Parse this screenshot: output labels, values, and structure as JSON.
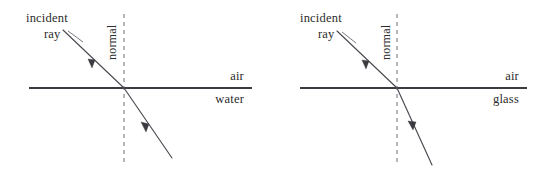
{
  "figure": {
    "type": "physics-optics-refraction-diagram",
    "panel_count": 2,
    "panels": [
      {
        "id": "water",
        "labels": {
          "incident_ray_line1": "incident",
          "incident_ray_line2": "ray",
          "normal": "normal",
          "upper_medium": "air",
          "lower_medium": "water"
        },
        "geometry": {
          "interface_y": 88,
          "interface_x_start": 29,
          "interface_x_end": 252,
          "normal_x": 124,
          "normal_y_top": 14,
          "normal_y_bottom": 162,
          "incidence_point_x": 124,
          "incidence_point_y": 88,
          "incident_start_x": 63,
          "incident_start_y": 30,
          "refracted_end_x": 172,
          "refracted_end_y": 158,
          "incident_arrow_t": 0.52,
          "refracted_arrow_t": 0.45
        },
        "angles": {
          "angle_of_incidence_deg": 44,
          "angle_of_refraction_deg": 34
        },
        "leader": {
          "x1": 68,
          "y1": 31,
          "x2": 83,
          "y2": 42
        },
        "text_positions": {
          "incident_line1_x": 26,
          "incident_line1_y": 22,
          "incident_line2_x": 44,
          "incident_line2_y": 38,
          "normal_x": 116,
          "normal_y": 60,
          "upper_medium_x": 244,
          "upper_medium_y": 80,
          "lower_medium_x": 244,
          "lower_medium_y": 103
        }
      },
      {
        "id": "glass",
        "labels": {
          "incident_ray_line1": "incident",
          "incident_ray_line2": "ray",
          "normal": "normal",
          "upper_medium": "air",
          "lower_medium": "glass"
        },
        "geometry": {
          "interface_y": 88,
          "interface_x_start": 300,
          "interface_x_end": 527,
          "normal_x": 397,
          "normal_y_top": 14,
          "normal_y_bottom": 162,
          "incidence_point_x": 397,
          "incidence_point_y": 88,
          "incident_start_x": 337,
          "incident_start_y": 31,
          "refracted_end_x": 432,
          "refracted_end_y": 165,
          "incident_arrow_t": 0.52,
          "refracted_arrow_t": 0.45
        },
        "angles": {
          "angle_of_incidence_deg": 44,
          "angle_of_refraction_deg": 23
        },
        "leader": {
          "x1": 342,
          "y1": 32,
          "x2": 356,
          "y2": 43
        },
        "text_positions": {
          "incident_line1_x": 300,
          "incident_line1_y": 22,
          "incident_line2_x": 318,
          "incident_line2_y": 38,
          "normal_x": 390,
          "normal_y": 60,
          "upper_medium_x": 519,
          "upper_medium_y": 80,
          "lower_medium_x": 519,
          "lower_medium_y": 103
        }
      }
    ],
    "colors": {
      "background": "#ffffff",
      "ray": "#4a4a52",
      "interface": "#3a3a40",
      "normal": "#6d6d72",
      "text": "#2b2b2b"
    }
  }
}
